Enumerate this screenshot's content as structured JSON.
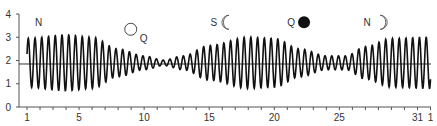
{
  "chart_data": {
    "type": "line",
    "title": "",
    "xlabel": "",
    "ylabel": "",
    "ylim": [
      0,
      4
    ],
    "xlim": [
      1,
      32
    ],
    "y_ticks": [
      0,
      1,
      2,
      3,
      4
    ],
    "x_tick_labels": [
      {
        "x": 1,
        "label": "1"
      },
      {
        "x": 5,
        "label": "5"
      },
      {
        "x": 10,
        "label": "10"
      },
      {
        "x": 15,
        "label": "15"
      },
      {
        "x": 20,
        "label": "20"
      },
      {
        "x": 25,
        "label": "25"
      },
      {
        "x": 31,
        "label": "31"
      },
      {
        "x": 32,
        "label": "1"
      }
    ],
    "mean_level": 1.85,
    "grid": false,
    "series": [
      {
        "name": "tide height",
        "description": "semi-diurnal oscillation, ~2 cycles per day",
        "envelope_amplitude_by_day": [
          {
            "day": 1,
            "amp": 1.05
          },
          {
            "day": 4,
            "amp": 1.2
          },
          {
            "day": 6,
            "amp": 1.1
          },
          {
            "day": 8,
            "amp": 0.6
          },
          {
            "day": 10,
            "amp": 0.3
          },
          {
            "day": 11.5,
            "amp": 0.12
          },
          {
            "day": 13,
            "amp": 0.3
          },
          {
            "day": 15,
            "amp": 0.75
          },
          {
            "day": 18,
            "amp": 1.1
          },
          {
            "day": 20,
            "amp": 1.05
          },
          {
            "day": 22,
            "amp": 0.6
          },
          {
            "day": 24,
            "amp": 0.3
          },
          {
            "day": 25.5,
            "amp": 0.3
          },
          {
            "day": 27,
            "amp": 0.7
          },
          {
            "day": 29,
            "amp": 1.05
          },
          {
            "day": 32,
            "amp": 1.1
          }
        ]
      }
    ],
    "annotations": [
      {
        "label": "N",
        "x": 1.9,
        "y": 3.6,
        "symbol": ""
      },
      {
        "label": "Q",
        "x": 9.2,
        "y": 3.3,
        "symbol": "full-moon"
      },
      {
        "label": "S",
        "x": 15.9,
        "y": 3.6,
        "symbol": "waning-crescent"
      },
      {
        "label": "Q",
        "x": 21.9,
        "y": 3.6,
        "symbol": "new-moon"
      },
      {
        "label": "N",
        "x": 27.6,
        "y": 3.6,
        "symbol": "waxing-crescent"
      }
    ]
  },
  "colors": {
    "line": "#111111",
    "axis": "#555555",
    "text": "#333333"
  }
}
